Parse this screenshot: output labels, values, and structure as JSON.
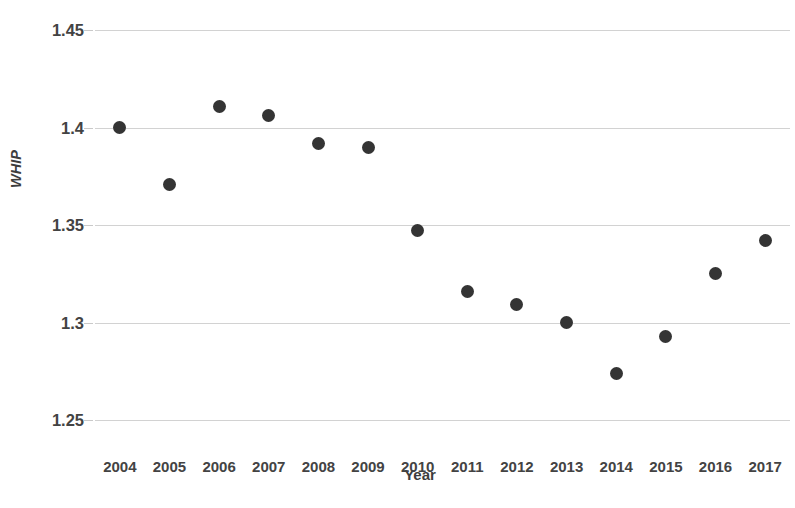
{
  "chart_data": {
    "type": "scatter",
    "title": "",
    "xlabel": "Year",
    "ylabel": "WHIP",
    "categories": [
      2004,
      2005,
      2006,
      2007,
      2008,
      2009,
      2010,
      2011,
      2012,
      2013,
      2014,
      2015,
      2016,
      2017
    ],
    "x": [
      2004,
      2005,
      2006,
      2007,
      2008,
      2009,
      2010,
      2011,
      2012,
      2013,
      2014,
      2015,
      2016,
      2017
    ],
    "values": [
      1.4,
      1.371,
      1.411,
      1.406,
      1.392,
      1.39,
      1.347,
      1.316,
      1.309,
      1.3,
      1.274,
      1.293,
      1.325,
      1.342
    ],
    "series": [
      {
        "name": "WHIP",
        "values": [
          1.4,
          1.371,
          1.411,
          1.406,
          1.392,
          1.39,
          1.347,
          1.316,
          1.309,
          1.3,
          1.274,
          1.293,
          1.325,
          1.342
        ]
      }
    ],
    "ylim": [
      1.25,
      1.45
    ],
    "xlim": [
      2003.5,
      2017.5
    ],
    "ytick_labels": [
      "1.45",
      "1.4",
      "1.35",
      "1.3",
      "1.25"
    ],
    "ytick_values": [
      1.45,
      1.4,
      1.35,
      1.3,
      1.25
    ],
    "xtick_labels": [
      "2004",
      "2005",
      "2006",
      "2007",
      "2008",
      "2009",
      "2010",
      "2011",
      "2012",
      "2013",
      "2014",
      "2015",
      "2016",
      "2017"
    ],
    "grid": "horizontal",
    "legend": "none",
    "marker_color": "#343434",
    "gridline_color": "#d2d2d2",
    "background_color": "#ffffff"
  },
  "axes": {
    "y_title": "WHIP",
    "x_title": "Year"
  },
  "title": {
    "text": ""
  }
}
